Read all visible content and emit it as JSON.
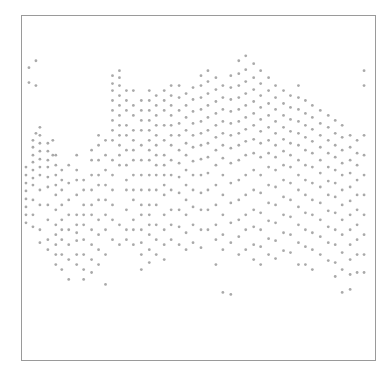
{
  "chart_data": {
    "type": "scatter",
    "title": "",
    "xlabel": "",
    "ylabel": "",
    "grid": false,
    "legend": null,
    "xlim": [
      0,
      355
    ],
    "ylim": [
      0,
      346
    ],
    "y_axis_inverted": true,
    "marker": {
      "color": "#8c8c8c",
      "size": 2,
      "halo_color": "#d0d0d0"
    },
    "columns": [
      {
        "x": 4,
        "y": [
          152,
          160,
          168,
          176,
          184,
          192,
          200,
          208
        ]
      },
      {
        "x": 7,
        "y": [
          52,
          67
        ]
      },
      {
        "x": 11,
        "y": [
          125,
          132,
          140,
          147,
          155,
          163,
          170,
          185,
          200,
          212
        ]
      },
      {
        "x": 14,
        "y": [
          45,
          70,
          118
        ]
      },
      {
        "x": 18,
        "y": [
          112,
          120,
          128,
          136,
          144,
          152,
          160,
          175,
          190,
          215,
          228
        ]
      },
      {
        "x": 26,
        "y": [
          128,
          136,
          145,
          152,
          162,
          172,
          190,
          205,
          225,
          235
        ]
      },
      {
        "x": 31,
        "y": [
          125,
          140
        ]
      },
      {
        "x": 34,
        "y": [
          140,
          150,
          160,
          170,
          180,
          195,
          210,
          220,
          230,
          240,
          250
        ]
      },
      {
        "x": 40,
        "y": [
          155,
          165,
          175,
          190,
          205,
          215,
          225,
          240,
          255
        ]
      },
      {
        "x": 47,
        "y": [
          150,
          168,
          185,
          200,
          215,
          230,
          245,
          265
        ]
      },
      {
        "x": 55,
        "y": [
          140,
          155,
          165,
          180,
          200,
          210,
          218,
          226,
          240,
          250
        ]
      },
      {
        "x": 62,
        "y": [
          165,
          175,
          190,
          200,
          210,
          225,
          240,
          255,
          265
        ]
      },
      {
        "x": 70,
        "y": [
          135,
          145,
          160,
          175,
          190,
          200,
          215,
          230,
          245,
          258
        ]
      },
      {
        "x": 77,
        "y": [
          120,
          130,
          145,
          160,
          170,
          185,
          205,
          220,
          235,
          250
        ]
      },
      {
        "x": 84,
        "y": [
          125,
          140,
          155,
          170,
          185,
          200,
          215,
          240,
          270
        ]
      },
      {
        "x": 91,
        "y": [
          60,
          68,
          75,
          85,
          95,
          105,
          115,
          125,
          145,
          160,
          175,
          190,
          205,
          225
        ]
      },
      {
        "x": 98,
        "y": [
          55,
          62,
          70,
          80,
          90,
          100,
          110,
          120,
          130,
          140,
          150,
          210,
          230
        ]
      },
      {
        "x": 105,
        "y": [
          75,
          85,
          95,
          110,
          120,
          135,
          150,
          165,
          175,
          195,
          215,
          225
        ]
      },
      {
        "x": 112,
        "y": [
          75,
          90,
          100,
          115,
          125,
          135,
          145,
          160,
          175,
          185,
          205,
          215,
          230
        ]
      },
      {
        "x": 120,
        "y": [
          85,
          95,
          105,
          115,
          130,
          145,
          160,
          175,
          190,
          200,
          215,
          228,
          240,
          255
        ]
      },
      {
        "x": 128,
        "y": [
          75,
          85,
          95,
          105,
          115,
          125,
          135,
          145,
          160,
          175,
          190,
          200,
          210,
          220,
          235,
          248
        ]
      },
      {
        "x": 135,
        "y": [
          80,
          90,
          100,
          110,
          120,
          130,
          140,
          150,
          160,
          175,
          190,
          210,
          225,
          240
        ]
      },
      {
        "x": 143,
        "y": [
          75,
          85,
          95,
          110,
          125,
          140,
          150,
          160,
          170,
          180,
          200,
          215,
          230,
          245
        ]
      },
      {
        "x": 150,
        "y": [
          70,
          80,
          90,
          100,
          110,
          120,
          130,
          145,
          160,
          175,
          195,
          210,
          225
        ]
      },
      {
        "x": 158,
        "y": [
          70,
          82,
          95,
          108,
          120,
          135,
          148,
          162,
          178,
          195,
          212,
          230
        ]
      },
      {
        "x": 165,
        "y": [
          78,
          90,
          102,
          115,
          128,
          140,
          155,
          170,
          185,
          200,
          218,
          235
        ]
      },
      {
        "x": 172,
        "y": [
          72,
          84,
          96,
          108,
          120,
          132,
          146,
          160,
          175,
          192,
          210,
          228
        ]
      },
      {
        "x": 180,
        "y": [
          60,
          70,
          82,
          94,
          106,
          118,
          130,
          144,
          160,
          178,
          195,
          215,
          233
        ]
      },
      {
        "x": 187,
        "y": [
          55,
          66,
          78,
          90,
          102,
          115,
          128,
          142,
          158,
          175,
          195,
          215
        ]
      },
      {
        "x": 195,
        "y": [
          62,
          74,
          86,
          98,
          110,
          122,
          135,
          150,
          170,
          190,
          210,
          225,
          250
        ]
      },
      {
        "x": 202,
        "y": [
          70,
          82,
          94,
          106,
          118,
          130,
          143,
          160,
          180,
          200,
          220,
          235,
          278
        ]
      },
      {
        "x": 210,
        "y": [
          60,
          72,
          84,
          96,
          108,
          120,
          133,
          148,
          168,
          188,
          208,
          228,
          280
        ]
      },
      {
        "x": 218,
        "y": [
          45,
          58,
          70,
          82,
          94,
          106,
          118,
          130,
          145,
          165,
          185,
          205,
          222,
          240
        ]
      },
      {
        "x": 225,
        "y": [
          40,
          54,
          66,
          78,
          90,
          102,
          114,
          126,
          140,
          160,
          180,
          200,
          215,
          235
        ]
      },
      {
        "x": 233,
        "y": [
          48,
          62,
          74,
          86,
          98,
          110,
          124,
          138,
          155,
          175,
          195,
          212,
          230,
          245
        ]
      },
      {
        "x": 240,
        "y": [
          55,
          68,
          80,
          92,
          104,
          116,
          128,
          142,
          160,
          178,
          198,
          215,
          232,
          250
        ]
      },
      {
        "x": 248,
        "y": [
          62,
          75,
          88,
          100,
          112,
          125,
          138,
          152,
          170,
          188,
          206,
          224,
          240
        ]
      },
      {
        "x": 255,
        "y": [
          70,
          82,
          94,
          106,
          118,
          130,
          142,
          155,
          172,
          190,
          208,
          226,
          244
        ]
      },
      {
        "x": 263,
        "y": [
          75,
          88,
          100,
          112,
          124,
          136,
          150,
          165,
          182,
          200,
          218,
          236
        ]
      },
      {
        "x": 270,
        "y": [
          80,
          92,
          104,
          116,
          128,
          140,
          152,
          168,
          185,
          202,
          220,
          238
        ]
      },
      {
        "x": 278,
        "y": [
          70,
          82,
          94,
          106,
          118,
          130,
          145,
          160,
          175,
          192,
          210,
          228,
          250
        ]
      },
      {
        "x": 285,
        "y": [
          85,
          98,
          110,
          122,
          135,
          150,
          165,
          180,
          198,
          215,
          232,
          250
        ]
      },
      {
        "x": 292,
        "y": [
          90,
          102,
          114,
          126,
          138,
          152,
          168,
          185,
          200,
          218,
          235,
          255
        ]
      },
      {
        "x": 300,
        "y": [
          95,
          108,
          120,
          132,
          145,
          158,
          172,
          188,
          205,
          222,
          240
        ]
      },
      {
        "x": 308,
        "y": [
          100,
          112,
          125,
          138,
          152,
          166,
          180,
          196,
          212,
          228,
          246
        ]
      },
      {
        "x": 315,
        "y": [
          105,
          118,
          130,
          142,
          155,
          168,
          182,
          198,
          215,
          230,
          248,
          262
        ]
      },
      {
        "x": 322,
        "y": [
          110,
          122,
          135,
          148,
          160,
          175,
          190,
          205,
          220,
          238,
          255,
          278
        ]
      },
      {
        "x": 330,
        "y": [
          120,
          132,
          145,
          158,
          172,
          186,
          200,
          215,
          230,
          245,
          260,
          275
        ]
      },
      {
        "x": 337,
        "y": [
          125,
          138,
          150,
          165,
          180,
          195,
          210,
          225,
          240,
          258
        ]
      },
      {
        "x": 344,
        "y": [
          55,
          70,
          120,
          140,
          160,
          180,
          200,
          220,
          240,
          258
        ]
      }
    ]
  }
}
